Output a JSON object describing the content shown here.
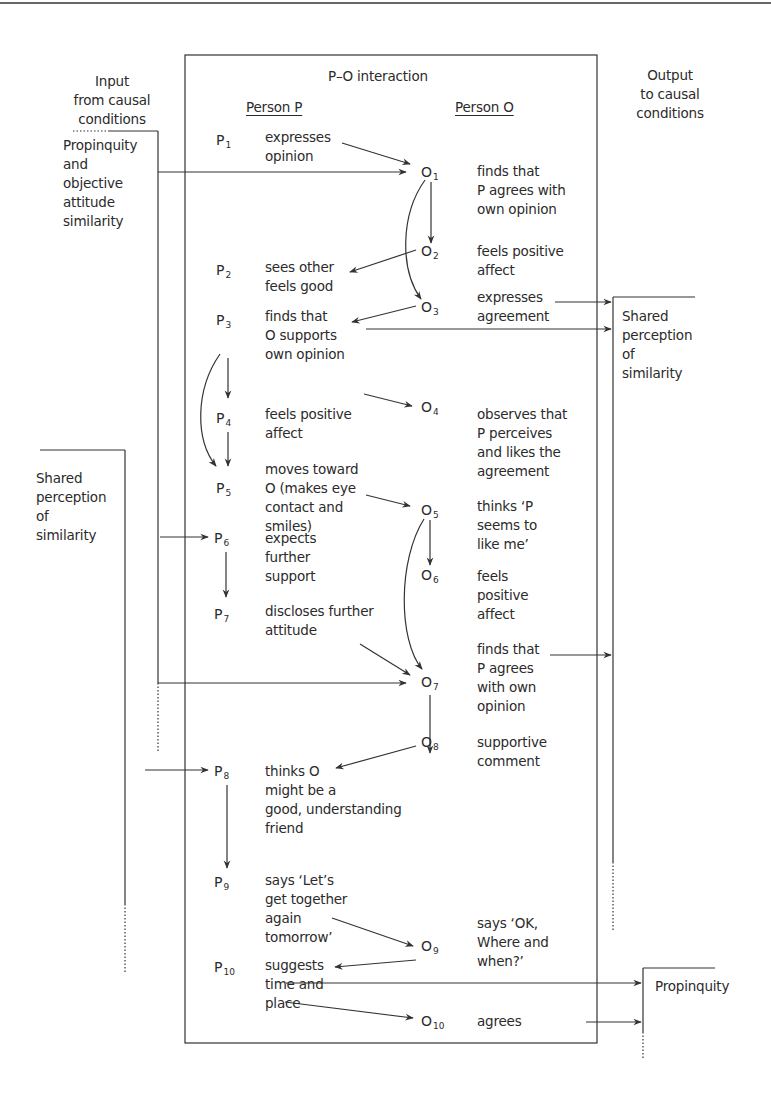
{
  "diagram": {
    "title": "P–O interaction",
    "input_header": "Input\nfrom causal\nconditions",
    "output_header": "Output\nto causal\nconditions",
    "person_p_header": "Person P",
    "person_o_header": "Person O",
    "left_inputs": [
      {
        "label": "Propinquity\nand\nobjective\nattitude\nsimilarity"
      },
      {
        "label": "Shared\nperception\nof\nsimilarity"
      }
    ],
    "right_outputs": [
      {
        "label": "Shared\nperception\nof\nsimilarity"
      },
      {
        "label": "Propinquity"
      }
    ],
    "p_steps": [
      {
        "id": "P",
        "sub": "1",
        "text": "expresses\nopinion"
      },
      {
        "id": "P",
        "sub": "2",
        "text": "sees other\nfeels good"
      },
      {
        "id": "P",
        "sub": "3",
        "text": "finds that\nO supports\nown opinion"
      },
      {
        "id": "P",
        "sub": "4",
        "text": "feels positive\naffect"
      },
      {
        "id": "P",
        "sub": "5",
        "text": "moves toward\nO (makes eye\ncontact and\nsmiles)"
      },
      {
        "id": "P",
        "sub": "6",
        "text": "expects\nfurther\nsupport"
      },
      {
        "id": "P",
        "sub": "7",
        "text": "discloses further\nattitude"
      },
      {
        "id": "P",
        "sub": "8",
        "text": "thinks O\nmight be a\ngood, understanding\nfriend"
      },
      {
        "id": "P",
        "sub": "9",
        "text": "says ‘Let’s\nget together\nagain\ntomorrow’"
      },
      {
        "id": "P",
        "sub": "10",
        "text": "suggests\ntime and\nplace"
      }
    ],
    "o_steps": [
      {
        "id": "O",
        "sub": "1",
        "text": "finds that\nP agrees with\nown opinion"
      },
      {
        "id": "O",
        "sub": "2",
        "text": "feels positive\naffect"
      },
      {
        "id": "O",
        "sub": "3",
        "text": "expresses\nagreement"
      },
      {
        "id": "O",
        "sub": "4",
        "text": "observes that\nP perceives\nand likes the\nagreement"
      },
      {
        "id": "O",
        "sub": "5",
        "text": "thinks ‘P\nseems to\nlike me’"
      },
      {
        "id": "O",
        "sub": "6",
        "text": "feels\npositive\naffect"
      },
      {
        "id": "O",
        "sub": "7",
        "text": "finds that\nP agrees\nwith own\nopinion"
      },
      {
        "id": "O",
        "sub": "8",
        "text": "supportive\ncomment"
      },
      {
        "id": "O",
        "sub": "9",
        "text": "says ‘OK,\nWhere and\nwhen?’"
      },
      {
        "id": "O",
        "sub": "10",
        "text": "agrees"
      }
    ],
    "colors": {
      "line": "#333333",
      "text": "#2b2b2b",
      "background": "#ffffff"
    }
  }
}
